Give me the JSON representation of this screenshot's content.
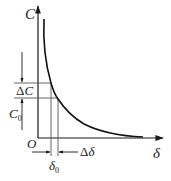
{
  "diagram": {
    "title": "",
    "colors": {
      "line": "#1a1a1a",
      "curve": "#111111",
      "guide": "#555555",
      "background": "#ffffff"
    },
    "axes": {
      "y_label": "C",
      "x_label": "δ",
      "origin_label": "O"
    },
    "annotations": {
      "delta_c": {
        "delta": "Δ",
        "var": "C"
      },
      "c0": {
        "var": "C",
        "sub": "0"
      },
      "delta0": {
        "var": "δ",
        "sub": "0"
      },
      "delta_delta": {
        "delta": "Δ",
        "var": "δ"
      }
    },
    "curve": {
      "type": "hyperbolic-decay",
      "description": "C decreases inversely with δ"
    }
  }
}
